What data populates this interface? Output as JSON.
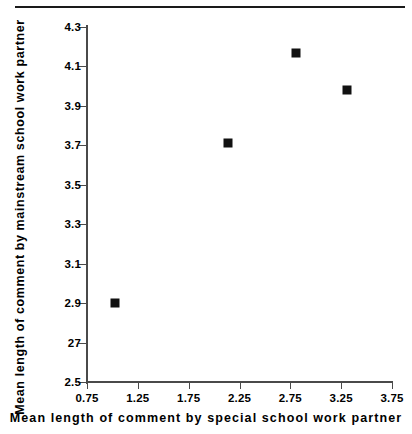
{
  "chart_data": {
    "type": "scatter",
    "title": "",
    "xlabel": "Mean  length  of  comment  by  special  school  work  partner",
    "ylabel": "Mean length of comment by mainstream school work partner",
    "xlim": [
      0.75,
      3.75
    ],
    "ylim": [
      2.5,
      4.3
    ],
    "xticks": [
      "0.75",
      "1.25",
      "1.75",
      "2.25",
      "2.75",
      "3.25",
      "3.75"
    ],
    "xtick_values": [
      0.75,
      1.25,
      1.75,
      2.25,
      2.75,
      3.25,
      3.75
    ],
    "yticks": [
      "4.3",
      "4.1",
      "3.9",
      "3.7",
      "3.5",
      "3.3",
      "3.1",
      "2.9",
      "27",
      "2.5"
    ],
    "ytick_values": [
      4.3,
      4.1,
      3.9,
      3.7,
      3.5,
      3.3,
      3.1,
      2.9,
      2.7,
      2.5
    ],
    "grid": false,
    "legend": false,
    "marker": "filled-square",
    "marker_color": "#111111",
    "points": [
      {
        "x": 1.03,
        "y": 2.9
      },
      {
        "x": 2.14,
        "y": 3.71
      },
      {
        "x": 2.81,
        "y": 4.17
      },
      {
        "x": 3.31,
        "y": 3.98
      }
    ],
    "x": [
      1.03,
      2.14,
      2.81,
      3.31
    ],
    "values": [
      2.9,
      3.71,
      4.17,
      3.98
    ]
  },
  "figure": {
    "background": "#ffffff",
    "axis_color": "#4a4a4a",
    "rule_color": "#1a1a1a"
  }
}
